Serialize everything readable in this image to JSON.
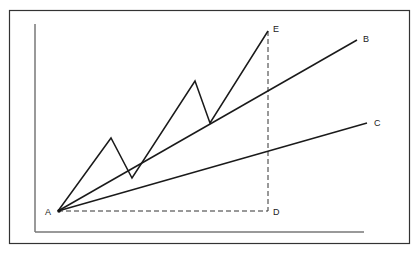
{
  "diagram": {
    "type": "trendline-diagram",
    "labels": {
      "A": "A",
      "B": "B",
      "C": "C",
      "D": "D",
      "E": "E"
    },
    "points": {
      "A": [
        58,
        211
      ],
      "B": [
        357,
        40
      ],
      "C": [
        367,
        123
      ],
      "D": [
        268,
        211
      ],
      "E": [
        268,
        31
      ]
    },
    "zigzag": [
      [
        58,
        211
      ],
      [
        111,
        138
      ],
      [
        132,
        178
      ],
      [
        195,
        81
      ],
      [
        210,
        123
      ],
      [
        268,
        31
      ]
    ],
    "colors": {
      "line": "#1a1a1a",
      "frame": "#333333",
      "axis": "#777777"
    }
  }
}
